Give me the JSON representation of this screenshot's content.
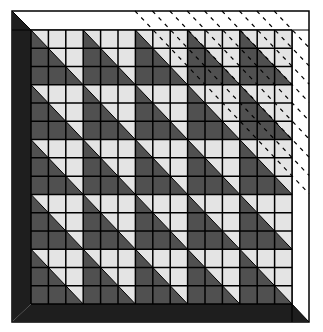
{
  "title": "Quilt block grid with diagonal half-square triangles",
  "colors": {
    "background": "#ffffff",
    "frame_dark": "#1e1e1e",
    "frame_light": "#ffffff",
    "cell_dark": "#505050",
    "cell_light": "#e4e4e4",
    "grid_line": "#000000",
    "dash_line": "#000000"
  },
  "frame": {
    "outer": {
      "x": 12,
      "y": 11,
      "right": 309,
      "bottom": 322
    },
    "inner": {
      "x": 31,
      "y": 30,
      "right": 292,
      "bottom": 304
    },
    "left_band": "dark",
    "bottom_band": "dark",
    "top_band": "light",
    "right_band": "light"
  },
  "grid": {
    "columns": 15,
    "rows": 15,
    "block_size": 3,
    "block_pattern": [
      [
        "diagonal",
        "light",
        "light"
      ],
      [
        "dark",
        "diagonal",
        "light"
      ],
      [
        "dark",
        "dark",
        "diagonal"
      ]
    ],
    "diagonal_cell": {
      "upper_right": "light",
      "lower_left": "dark"
    }
  },
  "overlay": {
    "type": "dashed-diagonals",
    "region": "upper-right triangle",
    "line_count": 9,
    "start_x_at_top": 135,
    "spacing": 17.4,
    "dash_pattern": "4 5"
  }
}
